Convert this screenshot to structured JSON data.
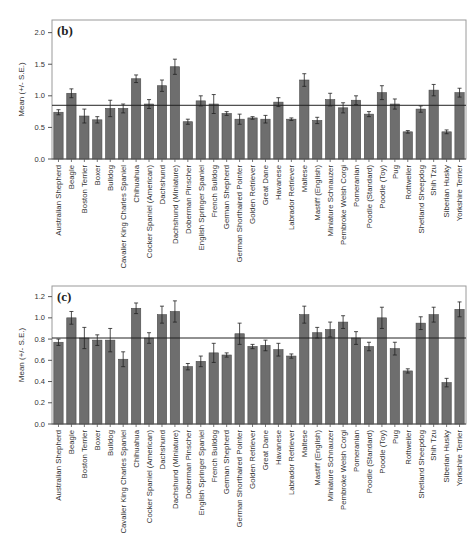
{
  "chart_data": [
    {
      "type": "bar",
      "panel_label": "(b)",
      "title": "",
      "xlabel": "",
      "ylabel": "Mean (+/- S.E.)",
      "ylim": [
        0.0,
        2.2
      ],
      "yticks": [
        "0.0",
        "0.5",
        "1.0",
        "1.5",
        "2.0"
      ],
      "grid": false,
      "reference_line": 0.85,
      "categories": [
        "Australian Shepherd",
        "Beagle",
        "Boston Terrier",
        "Boxer",
        "Bulldog",
        "Cavalier King Charles Spaniel",
        "Chihuahua",
        "Cocker Spaniel (American)",
        "Dachshund",
        "Dachshund (Miniature)",
        "Doberman Pinscher",
        "English Springer Spaniel",
        "French Bulldog",
        "German Shepherd",
        "German Shorthaired Pointer",
        "Golden Retriever",
        "Great Dane",
        "Havanese",
        "Labrador Retriever",
        "Maltese",
        "Mastiff (English)",
        "Miniature Schnauzer",
        "Pembroke Welsh Corgi",
        "Pomeranian",
        "Poodle (Standard)",
        "Poodle (Toy)",
        "Pug",
        "Rottweiler",
        "Shetland Sheepdog",
        "Shih Tzu",
        "Siberian Husky",
        "Yorkshire Terrier"
      ],
      "values": [
        0.74,
        1.04,
        0.68,
        0.62,
        0.8,
        0.8,
        1.27,
        0.87,
        1.16,
        1.46,
        0.59,
        0.92,
        0.87,
        0.72,
        0.63,
        0.65,
        0.63,
        0.9,
        0.63,
        1.25,
        0.61,
        0.94,
        0.81,
        0.93,
        0.71,
        1.05,
        0.87,
        0.43,
        0.79,
        1.09,
        0.43,
        1.05
      ],
      "errors": [
        0.04,
        0.07,
        0.11,
        0.05,
        0.13,
        0.07,
        0.06,
        0.07,
        0.09,
        0.12,
        0.04,
        0.08,
        0.15,
        0.03,
        0.08,
        0.02,
        0.06,
        0.07,
        0.02,
        0.1,
        0.05,
        0.1,
        0.08,
        0.07,
        0.04,
        0.11,
        0.08,
        0.02,
        0.05,
        0.09,
        0.03,
        0.07
      ]
    },
    {
      "type": "bar",
      "panel_label": "(c)",
      "title": "",
      "xlabel": "",
      "ylabel": "Mean (+/- S.E.)",
      "ylim": [
        0.0,
        1.3
      ],
      "yticks": [
        "0.0",
        "0.2",
        "0.4",
        "0.6",
        "0.8",
        "1.0",
        "1.2"
      ],
      "grid": false,
      "reference_line": 0.81,
      "categories": [
        "Australian Shepherd",
        "Beagle",
        "Boston Terrier",
        "Boxer",
        "Bulldog",
        "Cavalier King Charles Spaniel",
        "Chihuahua",
        "Cocker Spaniel (American)",
        "Dachshund",
        "Dachshund (Miniature)",
        "Doberman Pinscher",
        "English Springer Spaniel",
        "French Bulldog",
        "German Shepherd",
        "German Shorthaired Pointer",
        "Golden Retriever",
        "Great Dane",
        "Havanese",
        "Labrador Retriever",
        "Maltese",
        "Mastiff (English)",
        "Miniature Schnauzer",
        "Pembroke Welsh Corgi",
        "Pomeranian",
        "Poodle (Standard)",
        "Poodle (Toy)",
        "Pug",
        "Rottweiler",
        "Shetland Sheepdog",
        "Shih Tzu",
        "Siberian Husky",
        "Yorkshire Terrier"
      ],
      "values": [
        0.77,
        1.0,
        0.81,
        0.79,
        0.79,
        0.61,
        1.09,
        0.81,
        1.03,
        1.06,
        0.54,
        0.59,
        0.67,
        0.65,
        0.85,
        0.73,
        0.74,
        0.7,
        0.64,
        1.03,
        0.86,
        0.89,
        0.96,
        0.81,
        0.73,
        1.0,
        0.71,
        0.5,
        0.95,
        1.03,
        0.39,
        1.08
      ],
      "errors": [
        0.03,
        0.06,
        0.1,
        0.05,
        0.11,
        0.07,
        0.05,
        0.05,
        0.08,
        0.1,
        0.03,
        0.05,
        0.09,
        0.02,
        0.1,
        0.02,
        0.05,
        0.06,
        0.02,
        0.08,
        0.05,
        0.07,
        0.06,
        0.06,
        0.04,
        0.1,
        0.06,
        0.02,
        0.06,
        0.07,
        0.04,
        0.07
      ]
    }
  ]
}
